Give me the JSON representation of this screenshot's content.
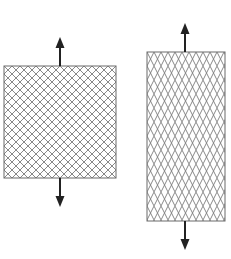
{
  "diagram": {
    "colors": {
      "mesh_line": "#7a7a7a",
      "border": "#6a6a6a",
      "arrow": "#222222",
      "background": "#ffffff"
    },
    "panels": [
      {
        "id": "unstretched",
        "x": 4,
        "y": 66,
        "width": 112,
        "height": 112,
        "cell_w": 8,
        "cell_h": 8,
        "arrow_x": 60,
        "arrow_up_tip": 37,
        "arrow_down_tip": 207
      },
      {
        "id": "stretched",
        "x": 147,
        "y": 52,
        "width": 78,
        "height": 169,
        "cell_w": 7,
        "cell_h": 14,
        "arrow_x": 185,
        "arrow_up_tip": 23,
        "arrow_down_tip": 250
      }
    ]
  }
}
